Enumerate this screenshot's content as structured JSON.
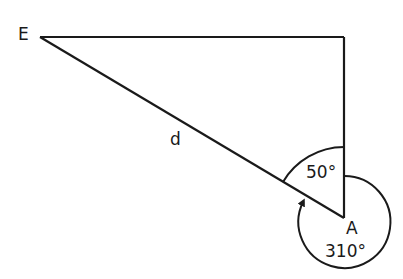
{
  "diagram": {
    "title": "",
    "labels": {
      "point_e": "E",
      "point_a": "A",
      "side_d": "d",
      "angle_inner": "50°",
      "angle_bearing": "310°"
    },
    "stroke_color": "#1a1a1a",
    "background": "#ffffff"
  }
}
